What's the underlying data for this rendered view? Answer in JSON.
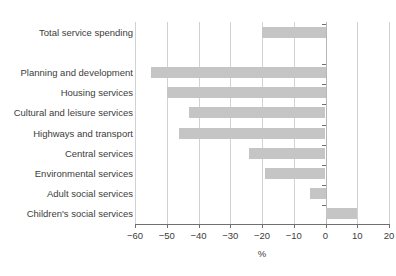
{
  "figure": {
    "title_remnant": "",
    "bar_color": "#c5c5c5",
    "grid_color": "#d2d2d2",
    "axis_color": "#6f6f6f",
    "text_color": "#3c3c3c"
  },
  "chart_data": {
    "type": "bar",
    "orientation": "horizontal",
    "title": "",
    "xlabel": "%",
    "ylabel": "",
    "xlim": [
      -60,
      20
    ],
    "xticks": [
      -60,
      -50,
      -40,
      -30,
      -20,
      -10,
      0,
      10,
      20
    ],
    "xticklabels": [
      "−60",
      "−50",
      "−40",
      "−30",
      "−20",
      "−10",
      "0",
      "10",
      "20"
    ],
    "grid": true,
    "grid_axis": "x",
    "legend": null,
    "categories": [
      "Total service spending",
      "Planning and development",
      "Housing services",
      "Cultural and leisure services",
      "Highways and transport",
      "Central services",
      "Environmental services",
      "Adult social services",
      "Children's social services"
    ],
    "values": [
      -20,
      -55,
      -50,
      -43,
      -46,
      -24,
      -19,
      -5,
      10
    ],
    "group_gap_after_index": 0
  }
}
